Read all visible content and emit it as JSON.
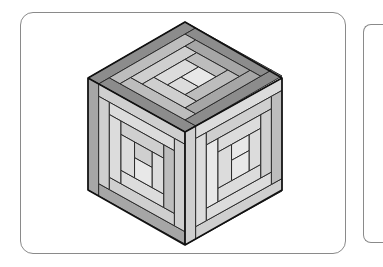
{
  "figure": {
    "frame": {
      "border_color": "#8a8a8a"
    },
    "cube": {
      "vertices": {
        "top": [
          185,
          22
        ],
        "left": [
          88,
          78
        ],
        "right": [
          282,
          78
        ],
        "center": [
          185,
          132
        ],
        "bottom_left": [
          88,
          190
        ],
        "bottom_right": [
          282,
          190
        ],
        "bottom": [
          185,
          245
        ]
      },
      "colors": {
        "dark": "#8c8c8c",
        "mid_dark": "#a6a6a6",
        "mid": "#bdbdbd",
        "light": "#cfcfcf",
        "lighter": "#dcdcdc",
        "center": "#e8e8e8",
        "stroke": "#2a2a2a",
        "edge": "#111111"
      },
      "faces": {
        "top": {
          "pieces": [
            {
              "x": 0,
              "y": 0,
              "w": 100,
              "h": 11,
              "c": "dark"
            },
            {
              "x": 0,
              "y": 11,
              "w": 11,
              "h": 89,
              "c": "dark"
            },
            {
              "x": 11,
              "y": 89,
              "w": 89,
              "h": 11,
              "c": "dark"
            },
            {
              "x": 89,
              "y": 11,
              "w": 11,
              "h": 78,
              "c": "dark"
            },
            {
              "x": 11,
              "y": 11,
              "w": 78,
              "h": 11,
              "c": "mid"
            },
            {
              "x": 11,
              "y": 22,
              "w": 11,
              "h": 67,
              "c": "mid"
            },
            {
              "x": 22,
              "y": 78,
              "w": 67,
              "h": 11,
              "c": "mid_dark"
            },
            {
              "x": 78,
              "y": 22,
              "w": 11,
              "h": 56,
              "c": "mid_dark"
            },
            {
              "x": 22,
              "y": 22,
              "w": 56,
              "h": 12,
              "c": "light"
            },
            {
              "x": 22,
              "y": 34,
              "w": 12,
              "h": 44,
              "c": "light"
            },
            {
              "x": 34,
              "y": 66,
              "w": 44,
              "h": 12,
              "c": "mid"
            },
            {
              "x": 66,
              "y": 34,
              "w": 12,
              "h": 32,
              "c": "mid"
            },
            {
              "x": 34,
              "y": 34,
              "w": 32,
              "h": 14,
              "c": "lighter"
            },
            {
              "x": 34,
              "y": 48,
              "w": 14,
              "h": 18,
              "c": "lighter"
            },
            {
              "x": 48,
              "y": 48,
              "w": 18,
              "h": 18,
              "c": "center"
            }
          ]
        },
        "left": {
          "pieces": [
            {
              "x": 0,
              "y": 0,
              "w": 11,
              "h": 100,
              "c": "mid_dark"
            },
            {
              "x": 11,
              "y": 0,
              "w": 89,
              "h": 11,
              "c": "light"
            },
            {
              "x": 11,
              "y": 89,
              "w": 89,
              "h": 11,
              "c": "mid_dark"
            },
            {
              "x": 89,
              "y": 11,
              "w": 11,
              "h": 78,
              "c": "light"
            },
            {
              "x": 11,
              "y": 11,
              "w": 11,
              "h": 78,
              "c": "light"
            },
            {
              "x": 22,
              "y": 11,
              "w": 67,
              "h": 11,
              "c": "lighter"
            },
            {
              "x": 22,
              "y": 78,
              "w": 67,
              "h": 11,
              "c": "light"
            },
            {
              "x": 78,
              "y": 22,
              "w": 11,
              "h": 56,
              "c": "mid"
            },
            {
              "x": 22,
              "y": 22,
              "w": 12,
              "h": 56,
              "c": "lighter"
            },
            {
              "x": 34,
              "y": 22,
              "w": 44,
              "h": 12,
              "c": "light"
            },
            {
              "x": 34,
              "y": 66,
              "w": 44,
              "h": 12,
              "c": "lighter"
            },
            {
              "x": 66,
              "y": 34,
              "w": 12,
              "h": 32,
              "c": "lighter"
            },
            {
              "x": 34,
              "y": 34,
              "w": 14,
              "h": 32,
              "c": "lighter"
            },
            {
              "x": 48,
              "y": 34,
              "w": 18,
              "h": 14,
              "c": "light"
            },
            {
              "x": 48,
              "y": 48,
              "w": 18,
              "h": 18,
              "c": "center"
            }
          ]
        },
        "right": {
          "pieces": [
            {
              "x": 0,
              "y": 0,
              "w": 11,
              "h": 100,
              "c": "light"
            },
            {
              "x": 11,
              "y": 0,
              "w": 89,
              "h": 11,
              "c": "lighter"
            },
            {
              "x": 11,
              "y": 89,
              "w": 89,
              "h": 11,
              "c": "light"
            },
            {
              "x": 89,
              "y": 11,
              "w": 11,
              "h": 78,
              "c": "mid"
            },
            {
              "x": 11,
              "y": 11,
              "w": 11,
              "h": 78,
              "c": "lighter"
            },
            {
              "x": 22,
              "y": 11,
              "w": 67,
              "h": 11,
              "c": "light"
            },
            {
              "x": 22,
              "y": 78,
              "w": 67,
              "h": 11,
              "c": "lighter"
            },
            {
              "x": 78,
              "y": 22,
              "w": 11,
              "h": 56,
              "c": "light"
            },
            {
              "x": 22,
              "y": 22,
              "w": 12,
              "h": 56,
              "c": "center"
            },
            {
              "x": 34,
              "y": 22,
              "w": 44,
              "h": 12,
              "c": "lighter"
            },
            {
              "x": 34,
              "y": 66,
              "w": 44,
              "h": 12,
              "c": "lighter"
            },
            {
              "x": 66,
              "y": 34,
              "w": 12,
              "h": 32,
              "c": "lighter"
            },
            {
              "x": 34,
              "y": 34,
              "w": 14,
              "h": 32,
              "c": "lighter"
            },
            {
              "x": 48,
              "y": 34,
              "w": 18,
              "h": 14,
              "c": "center"
            },
            {
              "x": 48,
              "y": 48,
              "w": 18,
              "h": 18,
              "c": "center"
            }
          ]
        }
      }
    }
  }
}
